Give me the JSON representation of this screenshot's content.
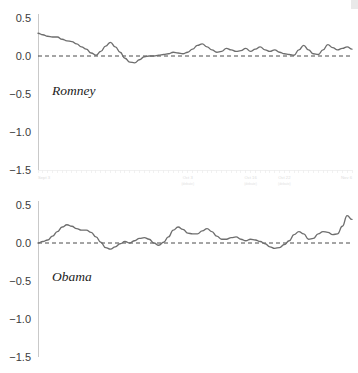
{
  "figure": {
    "title": "",
    "background_color": "#ffffff",
    "line_color": "#6e6e6e",
    "zero_line_color": "#4a4a4a",
    "axis_color": "#c9c9c9"
  },
  "chart_data": [
    {
      "type": "line",
      "title": "Romney",
      "series_label": "Romney",
      "xlabel": "",
      "ylabel": "",
      "ylim": [
        -1.75,
        0.62
      ],
      "yticks": [
        0.5,
        0.0,
        -0.5,
        -1.0,
        -1.5
      ],
      "ytick_labels": [
        "0.5",
        "0.0",
        "−0.5",
        "−1.0",
        "−1.5"
      ],
      "grid": false,
      "legend": "none",
      "zero_reference_line": 0.0,
      "xticks": [
        0,
        31,
        44,
        51,
        65
      ],
      "xtick_labels": [
        "Sept 3",
        "Oct 3",
        "Oct 16",
        "Oct 22",
        "Nov 6"
      ],
      "xtick_sublabels": [
        "",
        "(debate)",
        "(debate)",
        "(debate)",
        ""
      ],
      "x": [
        0,
        1,
        2,
        3,
        4,
        5,
        6,
        7,
        8,
        9,
        10,
        11,
        12,
        13,
        14,
        15,
        16,
        17,
        18,
        19,
        20,
        21,
        22,
        23,
        24,
        25,
        26,
        27,
        28,
        29,
        30,
        31,
        32,
        33,
        34,
        35,
        36,
        37,
        38,
        39,
        40,
        41,
        42,
        43,
        44,
        45,
        46,
        47,
        48,
        49,
        50,
        51,
        52,
        53,
        54,
        55,
        56,
        57,
        58,
        59,
        60,
        61,
        62,
        63,
        64,
        65
      ],
      "values": [
        0.3,
        0.28,
        0.26,
        0.25,
        0.25,
        0.22,
        0.2,
        0.19,
        0.16,
        0.12,
        0.09,
        0.04,
        0.01,
        0.06,
        0.13,
        0.18,
        0.12,
        0.05,
        -0.03,
        -0.08,
        -0.09,
        -0.05,
        -0.01,
        0.0,
        0.0,
        0.01,
        0.02,
        0.03,
        0.05,
        0.04,
        0.03,
        0.05,
        0.09,
        0.14,
        0.16,
        0.12,
        0.08,
        0.05,
        0.06,
        0.1,
        0.08,
        0.06,
        0.07,
        0.1,
        0.06,
        0.09,
        0.12,
        0.08,
        0.06,
        0.08,
        0.05,
        0.03,
        0.02,
        0.01,
        0.08,
        0.14,
        0.08,
        0.03,
        0.02,
        0.08,
        0.15,
        0.11,
        0.08,
        0.1,
        0.12,
        0.09
      ]
    },
    {
      "type": "line",
      "title": "Obama",
      "series_label": "Obama",
      "xlabel": "",
      "ylabel": "",
      "ylim": [
        -1.75,
        0.62
      ],
      "yticks": [
        0.5,
        0.0,
        -0.5,
        -1.0,
        -1.5
      ],
      "ytick_labels": [
        "0.5",
        "0.0",
        "−0.5",
        "−1.0",
        "−1.5"
      ],
      "grid": false,
      "legend": "none",
      "zero_reference_line": 0.0,
      "xticks": [
        0,
        31,
        44,
        51,
        65
      ],
      "xtick_labels": [
        "Sept 3",
        "Oct 3",
        "Oct 16",
        "Oct 22",
        "Nov 6"
      ],
      "xtick_sublabels": [
        "",
        "(debate)",
        "(debate)",
        "(debate)",
        ""
      ],
      "x": [
        0,
        1,
        2,
        3,
        4,
        5,
        6,
        7,
        8,
        9,
        10,
        11,
        12,
        13,
        14,
        15,
        16,
        17,
        18,
        19,
        20,
        21,
        22,
        23,
        24,
        25,
        26,
        27,
        28,
        29,
        30,
        31,
        32,
        33,
        34,
        35,
        36,
        37,
        38,
        39,
        40,
        41,
        42,
        43,
        44,
        45,
        46,
        47,
        48,
        49,
        50,
        51,
        52,
        53,
        54,
        55,
        56,
        57,
        58,
        59,
        60,
        61,
        62,
        63,
        64,
        65
      ],
      "values": [
        0.0,
        0.02,
        0.04,
        0.09,
        0.15,
        0.21,
        0.24,
        0.22,
        0.19,
        0.17,
        0.17,
        0.14,
        0.08,
        0.01,
        -0.06,
        -0.08,
        -0.05,
        -0.01,
        0.02,
        0.0,
        0.03,
        0.06,
        0.07,
        0.05,
        0.0,
        -0.03,
        0.01,
        0.08,
        0.17,
        0.21,
        0.18,
        0.13,
        0.12,
        0.12,
        0.16,
        0.19,
        0.15,
        0.09,
        0.05,
        0.05,
        0.07,
        0.08,
        0.05,
        0.03,
        0.05,
        0.04,
        0.02,
        -0.01,
        -0.05,
        -0.07,
        -0.06,
        -0.02,
        0.03,
        0.11,
        0.15,
        0.12,
        0.05,
        0.06,
        0.12,
        0.15,
        0.14,
        0.11,
        0.12,
        0.22,
        0.36,
        0.31
      ]
    }
  ]
}
